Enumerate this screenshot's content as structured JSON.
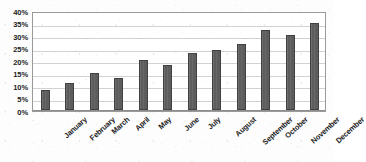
{
  "chart_data": {
    "type": "bar",
    "title": "",
    "xlabel": "",
    "ylabel": "",
    "categories": [
      "January",
      "February",
      "March",
      "April",
      "May",
      "June",
      "July",
      "August",
      "September",
      "October",
      "November",
      "December"
    ],
    "values": [
      8,
      11,
      15,
      13,
      20,
      18,
      23,
      24,
      26.5,
      32,
      30,
      35
    ],
    "ylim": [
      0,
      40
    ],
    "ytick_values": [
      0,
      5,
      10,
      15,
      20,
      25,
      30,
      35,
      40
    ],
    "ytick_labels": [
      "0%",
      "5%",
      "10%",
      "15%",
      "20%",
      "25%",
      "30%",
      "35%",
      "40%"
    ],
    "value_unit": "%",
    "grid": true,
    "grid_axis": "y",
    "legend": false,
    "legend_position": "none",
    "series": [
      {
        "name": "",
        "values": [
          8,
          11,
          15,
          13,
          20,
          18,
          23,
          24,
          26.5,
          32,
          30,
          35
        ]
      }
    ],
    "colors": {
      "bar_fill": "#5d5d5d",
      "bar_outline": "#414141",
      "gridline": "#d2d2d2",
      "plot_border": "#9a9a9a",
      "text": "#1c1c1c",
      "background": "#ffffff"
    }
  }
}
